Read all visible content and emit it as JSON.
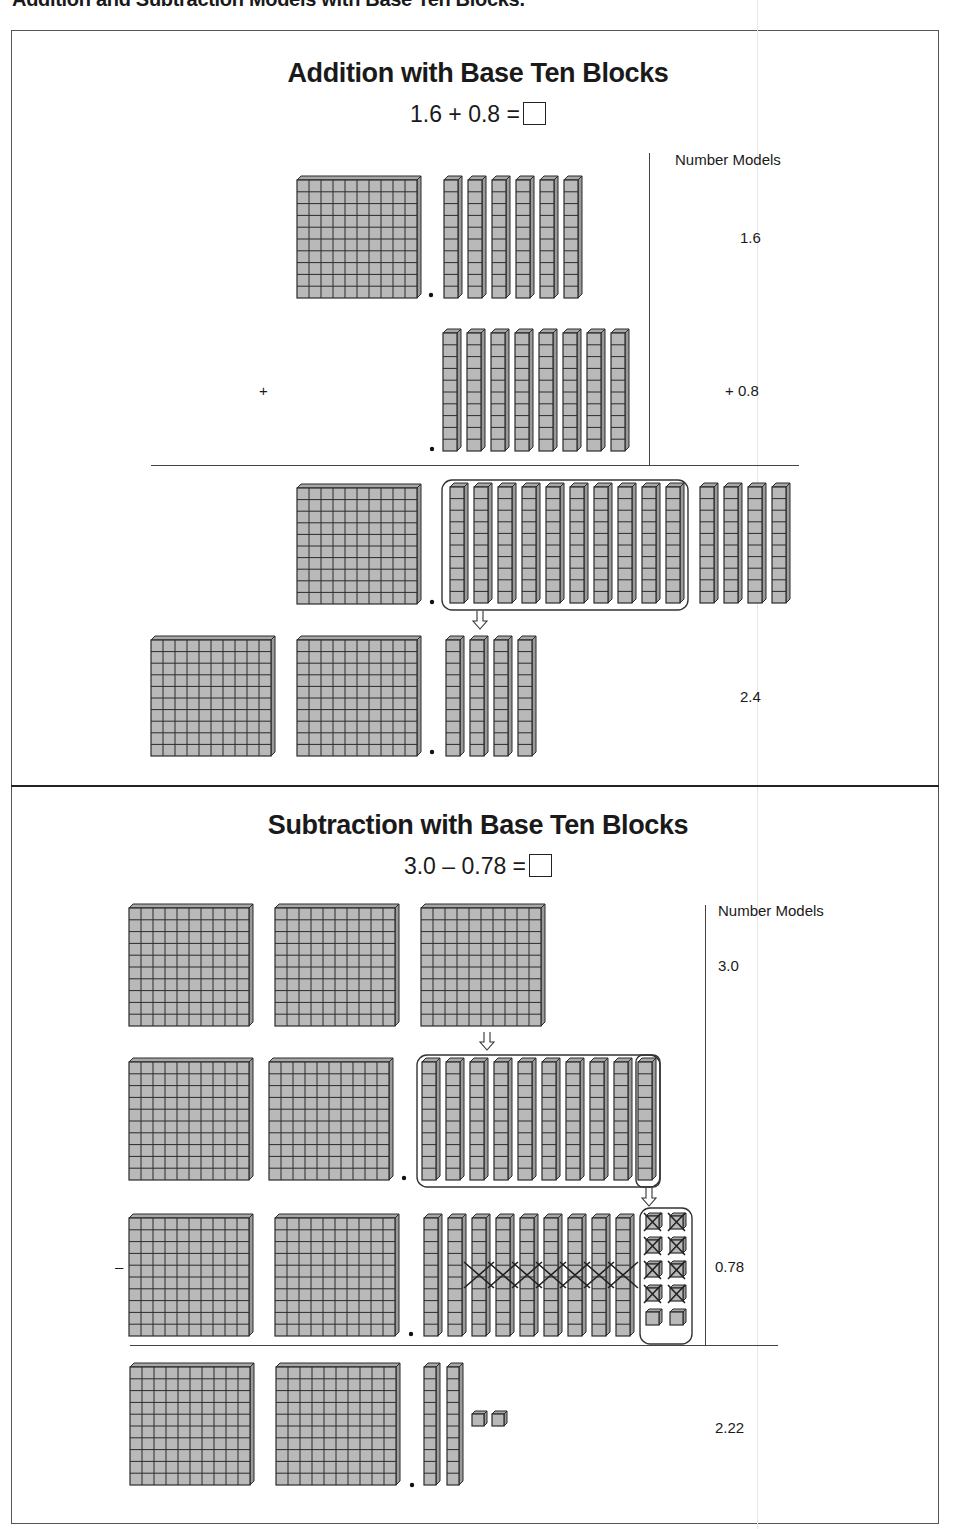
{
  "page": {
    "heading": "Addition and Subtraction Models with Base Ten Blocks."
  },
  "addition": {
    "title": "Addition with Base Ten Blocks",
    "equation": "1.6 + 0.8 =",
    "number_models_label": "Number Models",
    "operator": "+",
    "rows": [
      {
        "name": "addend-1",
        "flats": 1,
        "longs": 6,
        "cubes": 0,
        "number_model": "1.6"
      },
      {
        "name": "addend-2",
        "flats": 0,
        "longs": 8,
        "cubes": 0,
        "number_model": "+ 0.8"
      },
      {
        "name": "combined",
        "flats": 1,
        "longs": 14,
        "cubes": 0,
        "grouped_longs": 10,
        "number_model": ""
      },
      {
        "name": "regrouped",
        "flats": 2,
        "longs": 4,
        "cubes": 0,
        "number_model": "2.4"
      }
    ],
    "annotations": [
      "10 longs circled and traded for 1 flat (arrow down)"
    ]
  },
  "subtraction": {
    "title": "Subtraction with Base Ten Blocks",
    "equation": "3.0 – 0.78 =",
    "number_models_label": "Number Models",
    "operator": "–",
    "rows": [
      {
        "name": "start",
        "flats": 3,
        "longs": 0,
        "cubes": 0,
        "number_model": "3.0"
      },
      {
        "name": "trade-flat",
        "flats": 2,
        "longs": 10,
        "cubes": 0,
        "number_model": ""
      },
      {
        "name": "trade-long",
        "flats": 2,
        "longs": 9,
        "cubes": 10,
        "crossed_longs": 7,
        "crossed_cubes": 8,
        "number_model": "0.78"
      },
      {
        "name": "result",
        "flats": 2,
        "longs": 2,
        "cubes": 2,
        "number_model": "2.22"
      }
    ],
    "annotations": [
      "1 flat traded for 10 longs",
      "1 long traded for 10 cubes",
      "7 longs and 8 cubes crossed out"
    ]
  },
  "colors": {
    "block_fill": "#b9b9b9",
    "block_line": "#2a2a2a",
    "frame": "#555555",
    "text": "#1a1a1a"
  }
}
